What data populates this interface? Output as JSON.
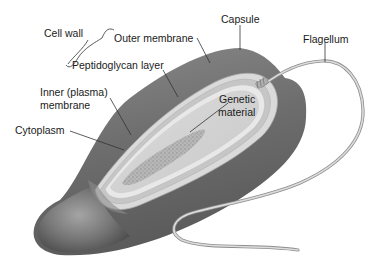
{
  "figure": {
    "labels": {
      "cell_wall": "Cell wall",
      "outer_membrane": "Outer membrane",
      "peptidoglycan_layer": "Peptidoglycan layer",
      "inner_membrane_line1": "Inner (plasma)",
      "inner_membrane_line2": "membrane",
      "cytoplasm": "Cytoplasm",
      "capsule": "Capsule",
      "flagellum": "Flagellum",
      "genetic_material_line1": "Genetic",
      "genetic_material_line2": "material"
    },
    "colors": {
      "capsule": "#6f6f6f",
      "capsule_highlight": "#9a9a9a",
      "outer_membrane": "#d8d8d8",
      "peptidoglycan": "#c4c4c4",
      "inner_membrane": "#e6e6e6",
      "cytoplasm": "#cfcfcf",
      "genetic_material": "#a8a8a8",
      "flagellum": "#bdbdbd",
      "label_text": "#1a1a1a",
      "leader_line": "#333333"
    }
  }
}
